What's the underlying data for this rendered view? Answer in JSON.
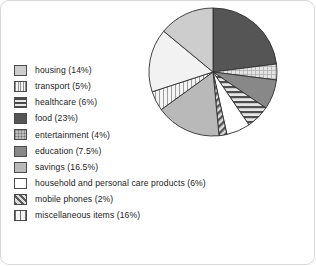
{
  "chart_data": {
    "type": "pie",
    "title": "",
    "legend_position": "left",
    "start_angle_deg": 0,
    "direction": "clockwise",
    "categories": [
      "housing",
      "transport",
      "healthcare",
      "food",
      "entertainment",
      "education",
      "savings",
      "household and personal care products",
      "mobile phones",
      "miscellaneous items"
    ],
    "values": [
      14,
      5,
      6,
      23,
      4,
      7.5,
      16.5,
      6,
      2,
      16
    ],
    "units": "%",
    "slice_order_clockwise_from_top": [
      "food",
      "entertainment",
      "education",
      "healthcare",
      "household and personal care products",
      "mobile phones",
      "savings",
      "transport",
      "miscellaneous items",
      "housing"
    ],
    "data_labels_shown": false,
    "grid": false
  },
  "legend": {
    "items": [
      {
        "label": "housing (14%)",
        "name": "housing",
        "value": 14,
        "pattern": "solid-light-gray",
        "fill": "#cdcdcd"
      },
      {
        "label": "transport (5%)",
        "name": "transport",
        "value": 5,
        "pattern": "vertical-lines-light",
        "fill": "#efefef"
      },
      {
        "label": "healthcare (6%)",
        "name": "healthcare",
        "value": 6,
        "pattern": "horizontal-stripes",
        "fill": "#9a9a9a"
      },
      {
        "label": "food (23%)",
        "name": "food",
        "value": 23,
        "pattern": "solid-dark-gray",
        "fill": "#555555"
      },
      {
        "label": "entertainment (4%)",
        "name": "entertainment",
        "value": 4,
        "pattern": "crosshatch-light",
        "fill": "#d9d9d9"
      },
      {
        "label": "education (7.5%)",
        "name": "education",
        "value": 7.5,
        "pattern": "solid-medium-dark-gray",
        "fill": "#888888"
      },
      {
        "label": "savings (16.5%)",
        "name": "savings",
        "value": 16.5,
        "pattern": "solid-medium-gray",
        "fill": "#b9b9b9"
      },
      {
        "label": "household and personal care products (6%)",
        "name": "household",
        "value": 6,
        "pattern": "solid-white",
        "fill": "#ffffff"
      },
      {
        "label": "mobile phones (2%)",
        "name": "mobile-phones",
        "value": 2,
        "pattern": "diagonal-hatch",
        "fill": "#a8a8a8"
      },
      {
        "label": "miscellaneous items (16%)",
        "name": "miscellaneous-items",
        "value": 16,
        "pattern": "vertical-bars",
        "fill": "#f2f2f2"
      }
    ]
  },
  "colors": {
    "stroke": "#303030",
    "frame": "#d8d8d8",
    "background": "#ffffff",
    "text": "#232323"
  }
}
